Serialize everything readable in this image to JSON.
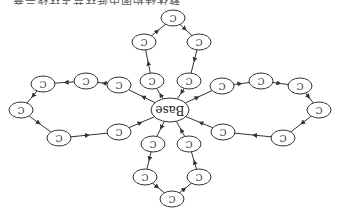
{
  "caption": "…整体结构图中循环节点环绕示意…",
  "diagram": {
    "orientation": "rotated-180",
    "center": {
      "id": "base",
      "label": "Base",
      "x": 170,
      "y": 110,
      "rx": 19,
      "ry": 12
    },
    "node_label": "C",
    "loops": [
      {
        "name": "top",
        "nodes": [
          [
            152,
            81
          ],
          [
            144,
            42
          ],
          [
            173,
            18
          ],
          [
            199,
            42
          ],
          [
            189,
            81
          ]
        ]
      },
      {
        "name": "left",
        "nodes": [
          [
            119,
            85
          ],
          [
            86,
            81
          ],
          [
            43,
            84
          ],
          [
            21,
            110
          ],
          [
            59,
            138
          ],
          [
            119,
            132
          ]
        ]
      },
      {
        "name": "right",
        "nodes": [
          [
            222,
            86
          ],
          [
            261,
            81
          ],
          [
            300,
            86
          ],
          [
            319,
            110
          ],
          [
            283,
            138
          ],
          [
            223,
            132
          ]
        ]
      },
      {
        "name": "bottom",
        "nodes": [
          [
            153,
            144
          ],
          [
            145,
            177
          ],
          [
            172,
            199
          ],
          [
            199,
            177
          ],
          [
            189,
            144
          ]
        ]
      }
    ]
  }
}
